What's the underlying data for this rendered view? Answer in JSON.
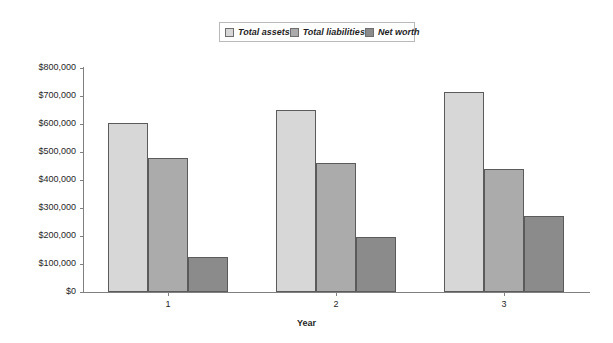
{
  "chart_data": {
    "type": "bar",
    "title": "",
    "xlabel": "Year",
    "ylabel": "",
    "categories": [
      "1",
      "2",
      "3"
    ],
    "series": [
      {
        "name": "Total assets",
        "values": [
          605000,
          650000,
          715000
        ],
        "color": "#d7d7d7"
      },
      {
        "name": "Total liabilities",
        "values": [
          480000,
          460000,
          440000
        ],
        "color": "#ababab"
      },
      {
        "name": "Net worth",
        "values": [
          125000,
          195000,
          272000
        ],
        "color": "#8b8b8b"
      }
    ],
    "ylim": [
      0,
      800000
    ],
    "ytick_values": [
      0,
      100000,
      200000,
      300000,
      400000,
      500000,
      600000,
      700000,
      800000
    ],
    "ytick_labels": [
      "$0",
      "$100,000",
      "$200,000",
      "$300,000",
      "$400,000",
      "$500,000",
      "$600,000",
      "$700,000",
      "$800,000"
    ],
    "grid": false,
    "legend_position": "top-center"
  },
  "legend": {
    "entries": [
      {
        "label": "Total assets"
      },
      {
        "label": "Total liabilities"
      },
      {
        "label": "Net worth"
      }
    ]
  },
  "axes": {
    "x_title": "Year"
  }
}
